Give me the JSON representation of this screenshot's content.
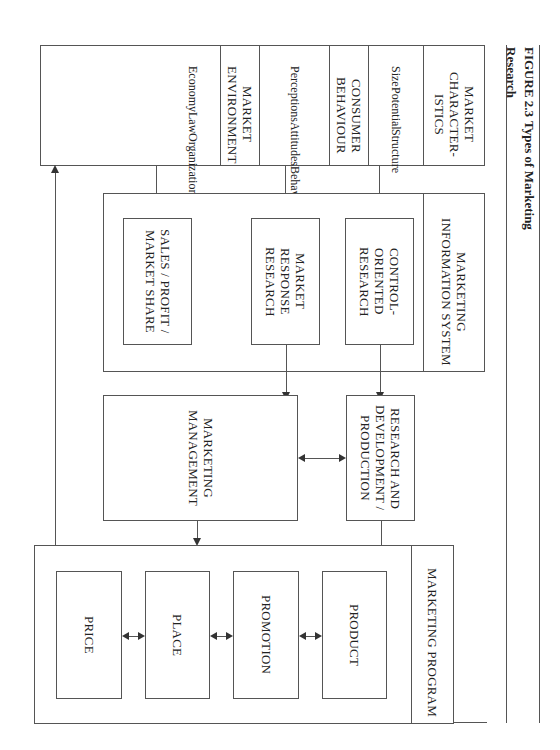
{
  "figure": {
    "number": "FIGURE 2.3",
    "title": "Types of Marketing Research"
  },
  "top_panel": {
    "market_characteristics": {
      "header": "MARKET CHARACTER- ISTICS",
      "items": [
        "Size",
        "Potential",
        "Structure"
      ]
    },
    "consumer_behaviour": {
      "header": "CONSUMER BEHAVIOUR",
      "items": [
        "Perceptions",
        "Attitudes",
        "Behaviours",
        "Culture"
      ]
    },
    "market_environment": {
      "header": "MARKET ENVIRONMENT",
      "items": [
        "Economy",
        "Law",
        "Organizations"
      ]
    }
  },
  "mis_panel": {
    "header": "MARKETING INFORMATION SYSTEM",
    "boxes": [
      {
        "label": "CONTROL- ORIENTED RESEARCH"
      },
      {
        "label": "MARKET RESPONSE RESEARCH"
      },
      {
        "label": "SALES / PROFIT / MARKET SHARE"
      }
    ]
  },
  "middle": {
    "rd_production": "RESEARCH AND DEVELOPMENT / PRODUCTION",
    "marketing_management": "MARKETING MANAGEMENT"
  },
  "program_panel": {
    "header": "MARKETING PROGRAM",
    "boxes": [
      {
        "label": "PRODUCT"
      },
      {
        "label": "PROMOTION"
      },
      {
        "label": "PLACE"
      },
      {
        "label": "PRICE"
      }
    ]
  }
}
